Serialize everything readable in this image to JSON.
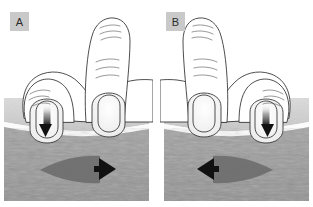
{
  "figure": {
    "background_color": "#ffffff",
    "panel_count": 2
  },
  "panels": [
    {
      "id": "panel-a",
      "label": "A",
      "label_badge_color": "#c9c9c9",
      "label_text_color": "#2b2b2b",
      "press_arrow": {
        "name": "downward-pressure-arrow",
        "direction": "down",
        "color": "#111111",
        "on_finger": "left"
      },
      "tissue_arrow": {
        "name": "tissue-shear-arrow",
        "direction": "right",
        "head_color": "#111111",
        "body_color": "#6e6e6e"
      }
    },
    {
      "id": "panel-b",
      "label": "B",
      "label_badge_color": "#c9c9c9",
      "label_text_color": "#2b2b2b",
      "press_arrow": {
        "name": "downward-pressure-arrow",
        "direction": "down",
        "color": "#111111",
        "on_finger": "right"
      },
      "tissue_arrow": {
        "name": "tissue-shear-arrow",
        "direction": "left",
        "head_color": "#111111",
        "body_color": "#6e6e6e"
      }
    }
  ],
  "layers": {
    "skin_band_color": "#d2d2d2",
    "fascia_line_color": "#fbfbfb",
    "muscle_color": "#9a9a9a",
    "outline_color": "#3a3a3a",
    "hand_fill_color": "#ffffff"
  }
}
